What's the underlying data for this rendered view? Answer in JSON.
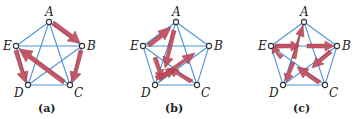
{
  "figure": {
    "node_labels": [
      "A",
      "B",
      "C",
      "D",
      "E"
    ],
    "edge_color": "#4f93d6",
    "arrow_color": "#c24b5c",
    "panels": [
      {
        "caption": "(a)",
        "offset_x": 0,
        "arrows": [
          [
            "A",
            "B"
          ],
          [
            "B",
            "C"
          ],
          [
            "C",
            "E"
          ],
          [
            "E",
            "D"
          ]
        ]
      },
      {
        "caption": "(b)",
        "offset_x": 127,
        "arrows": [
          [
            "E",
            "A"
          ],
          [
            "A",
            "D"
          ],
          [
            "D",
            "B"
          ],
          [
            "C",
            "D"
          ]
        ]
      },
      {
        "caption": "(c)",
        "offset_x": 255,
        "arrows": [
          [
            "D",
            "A"
          ],
          [
            "E",
            "B"
          ],
          [
            "B",
            "D"
          ],
          [
            "C",
            "E"
          ]
        ]
      }
    ]
  }
}
